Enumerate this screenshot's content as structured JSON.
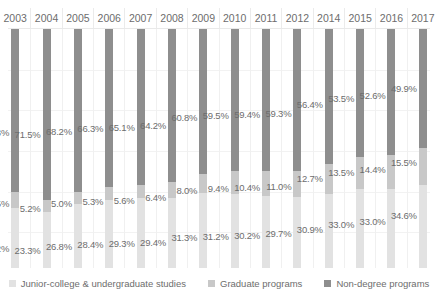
{
  "chart_data": {
    "type": "bar",
    "subtype": "100% stacked column",
    "title": "",
    "xlabel": "",
    "ylabel": "",
    "ylim": [
      0,
      100
    ],
    "grid": true,
    "legend_position": "bottom",
    "categories": [
      "2003",
      "2004",
      "2005",
      "2006",
      "2007",
      "2008",
      "2009",
      "2010",
      "2011",
      "2012",
      "2014",
      "2015",
      "2016",
      "2017"
    ],
    "series": [
      {
        "name": "Junior-college & undergraduate studies",
        "color": "#e2e2e2",
        "values": [
          25.2,
          23.3,
          26.8,
          28.4,
          29.3,
          29.4,
          31.3,
          31.2,
          30.2,
          29.7,
          30.9,
          33.0,
          33.0,
          34.6
        ],
        "labels": [
          "25.2%",
          "23.3%",
          "26.8%",
          "28.4%",
          "29.3%",
          "29.4%",
          "31.3%",
          "31.2%",
          "30.2%",
          "29.7%",
          "30.9%",
          "33.0%",
          "33.0%",
          "34.6%"
        ]
      },
      {
        "name": "Graduate programs",
        "color": "#c8c8c8",
        "values": [
          6.5,
          5.2,
          5.0,
          5.3,
          5.6,
          6.4,
          8.0,
          9.4,
          10.4,
          11.0,
          12.7,
          13.5,
          14.4,
          15.5
        ],
        "labels": [
          "6.5%",
          "5.2%",
          "5.0%",
          "5.3%",
          "5.6%",
          "6.4%",
          "8.0%",
          "9.4%",
          "10.4%",
          "11.0%",
          "12.7%",
          "13.5%",
          "14.4%",
          "15.5%"
        ]
      },
      {
        "name": "Non-degree programs",
        "color": "#8e8e8e",
        "values": [
          68.3,
          71.5,
          68.2,
          66.3,
          65.1,
          64.2,
          60.8,
          59.5,
          59.4,
          59.3,
          56.4,
          53.5,
          52.6,
          49.9
        ],
        "labels": [
          "68.3%",
          "71.5%",
          "68.2%",
          "66.3%",
          "65.1%",
          "64.2%",
          "60.8%",
          "59.5%",
          "59.4%",
          "59.3%",
          "56.4%",
          "53.5%",
          "52.6%",
          "49.9%"
        ]
      }
    ],
    "label_rows": {
      "nondegree_y_pct": [
        43,
        44,
        42.5,
        41.5,
        41,
        40,
        37,
        36,
        35.5,
        35,
        31.5,
        29,
        27.5,
        24.5
      ],
      "graduate_y_pct": [
        73,
        75,
        73,
        72,
        71.5,
        70.5,
        67.5,
        66.5,
        66,
        65.5,
        62.5,
        60,
        58.5,
        55.5
      ],
      "junior_y_pct": [
        91.5,
        92.5,
        91,
        90,
        89.5,
        89,
        87,
        86.5,
        86,
        85.5,
        83.5,
        81.5,
        80.5,
        78
      ]
    }
  },
  "legend": {
    "items": [
      {
        "label": "Junior-college & undergraduate studies",
        "color": "#e2e2e2"
      },
      {
        "label": "Graduate programs",
        "color": "#c8c8c8"
      },
      {
        "label": "Non-degree programs",
        "color": "#8e8e8e"
      }
    ]
  }
}
